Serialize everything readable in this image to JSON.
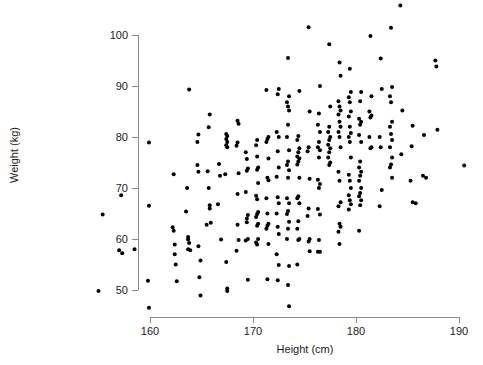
{
  "chart_data": {
    "type": "scatter",
    "title": "",
    "xlabel": "Height (cm)",
    "ylabel": "Weight (kg)",
    "xlim": [
      155,
      191
    ],
    "ylim": [
      46,
      106
    ],
    "xticks": [
      160,
      170,
      180,
      190
    ],
    "yticks": [
      50,
      60,
      70,
      80,
      90,
      100
    ],
    "xtick_labels": [
      "160",
      "170",
      "180",
      "190"
    ],
    "ytick_labels": [
      "50",
      "60",
      "70",
      "80",
      "90",
      "100"
    ],
    "grid": false,
    "legend": null,
    "marker": {
      "shape": "circle",
      "color": "#000000",
      "size_px": 4
    },
    "axis_color": "#8a8a8a",
    "background": "#ffffff",
    "n_points": 284,
    "points": [
      [
        155.0,
        49.8
      ],
      [
        157.0,
        57.8
      ],
      [
        157.3,
        57.2
      ],
      [
        158.5,
        58.0
      ],
      [
        159.9,
        78.9
      ],
      [
        159.9,
        66.5
      ],
      [
        159.8,
        51.8
      ],
      [
        159.9,
        46.5
      ],
      [
        157.2,
        68.6
      ],
      [
        155.4,
        64.8
      ],
      [
        162.3,
        72.7
      ],
      [
        162.2,
        62.3
      ],
      [
        162.3,
        61.6
      ],
      [
        162.4,
        58.9
      ],
      [
        162.4,
        57.0
      ],
      [
        162.5,
        55.0
      ],
      [
        162.6,
        51.7
      ],
      [
        163.8,
        89.3
      ],
      [
        163.6,
        70.0
      ],
      [
        163.5,
        65.4
      ],
      [
        163.7,
        60.4
      ],
      [
        163.7,
        59.9
      ],
      [
        163.8,
        59.2
      ],
      [
        163.7,
        58.0
      ],
      [
        163.9,
        57.8
      ],
      [
        164.7,
        80.5
      ],
      [
        164.6,
        79.0
      ],
      [
        164.6,
        74.5
      ],
      [
        164.7,
        73.2
      ],
      [
        164.7,
        58.6
      ],
      [
        164.8,
        52.5
      ],
      [
        164.9,
        48.9
      ],
      [
        164.9,
        55.8
      ],
      [
        165.8,
        84.4
      ],
      [
        165.7,
        81.9
      ],
      [
        165.6,
        73.3
      ],
      [
        165.7,
        70.0
      ],
      [
        165.8,
        66.6
      ],
      [
        165.8,
        66.0
      ],
      [
        165.9,
        63.2
      ],
      [
        165.5,
        62.8
      ],
      [
        166.7,
        74.7
      ],
      [
        166.8,
        72.4
      ],
      [
        166.6,
        66.8
      ],
      [
        166.9,
        59.9
      ],
      [
        167.4,
        80.6
      ],
      [
        167.5,
        80.2
      ],
      [
        167.4,
        79.6
      ],
      [
        167.5,
        79.0
      ],
      [
        167.4,
        78.4
      ],
      [
        167.5,
        78.0
      ],
      [
        167.4,
        55.5
      ],
      [
        167.5,
        50.3
      ],
      [
        167.5,
        49.8
      ],
      [
        167.3,
        72.7
      ],
      [
        168.5,
        83.2
      ],
      [
        168.6,
        82.6
      ],
      [
        168.5,
        78.9
      ],
      [
        168.4,
        78.3
      ],
      [
        168.6,
        72.9
      ],
      [
        168.5,
        68.8
      ],
      [
        168.5,
        62.8
      ],
      [
        168.6,
        59.8
      ],
      [
        168.4,
        57.7
      ],
      [
        169.3,
        77.0
      ],
      [
        169.4,
        75.7
      ],
      [
        169.5,
        73.8
      ],
      [
        169.4,
        73.4
      ],
      [
        169.3,
        69.2
      ],
      [
        169.5,
        64.7
      ],
      [
        169.4,
        64.0
      ],
      [
        169.4,
        63.3
      ],
      [
        169.5,
        60.0
      ],
      [
        169.3,
        59.7
      ],
      [
        169.5,
        52.0
      ],
      [
        170.4,
        79.4
      ],
      [
        170.3,
        78.4
      ],
      [
        170.4,
        76.2
      ],
      [
        170.5,
        74.0
      ],
      [
        170.4,
        73.6
      ],
      [
        170.5,
        71.0
      ],
      [
        170.3,
        68.5
      ],
      [
        170.4,
        67.8
      ],
      [
        170.5,
        65.3
      ],
      [
        170.4,
        64.9
      ],
      [
        170.3,
        64.3
      ],
      [
        170.5,
        63.0
      ],
      [
        170.4,
        62.6
      ],
      [
        170.5,
        60.0
      ],
      [
        170.3,
        59.3
      ],
      [
        170.4,
        58.9
      ],
      [
        171.3,
        89.2
      ],
      [
        171.5,
        80.0
      ],
      [
        171.4,
        79.6
      ],
      [
        171.3,
        79.0
      ],
      [
        171.5,
        75.8
      ],
      [
        171.4,
        72.0
      ],
      [
        171.5,
        71.5
      ],
      [
        171.3,
        68.0
      ],
      [
        171.4,
        65.0
      ],
      [
        171.5,
        63.0
      ],
      [
        171.4,
        62.6
      ],
      [
        171.3,
        62.0
      ],
      [
        171.5,
        59.0
      ],
      [
        171.4,
        52.1
      ],
      [
        172.5,
        89.4
      ],
      [
        172.4,
        88.4
      ],
      [
        172.3,
        81.0
      ],
      [
        172.5,
        80.0
      ],
      [
        172.4,
        77.2
      ],
      [
        172.5,
        74.0
      ],
      [
        172.3,
        72.2
      ],
      [
        172.4,
        68.2
      ],
      [
        172.5,
        67.0
      ],
      [
        172.3,
        65.0
      ],
      [
        172.4,
        62.4
      ],
      [
        172.5,
        61.0
      ],
      [
        172.3,
        57.0
      ],
      [
        172.5,
        54.9
      ],
      [
        172.4,
        51.9
      ],
      [
        173.4,
        95.5
      ],
      [
        173.5,
        88.0
      ],
      [
        173.3,
        86.8
      ],
      [
        173.4,
        86.0
      ],
      [
        173.5,
        85.2
      ],
      [
        173.4,
        82.4
      ],
      [
        173.3,
        80.0
      ],
      [
        173.5,
        77.4
      ],
      [
        173.4,
        75.2
      ],
      [
        173.3,
        74.5
      ],
      [
        173.5,
        73.5
      ],
      [
        173.4,
        72.0
      ],
      [
        173.3,
        68.0
      ],
      [
        173.5,
        67.0
      ],
      [
        173.4,
        65.5
      ],
      [
        173.3,
        64.9
      ],
      [
        173.5,
        63.4
      ],
      [
        173.4,
        62.0
      ],
      [
        173.3,
        60.0
      ],
      [
        173.5,
        54.7
      ],
      [
        173.4,
        51.0
      ],
      [
        173.5,
        46.8
      ],
      [
        174.5,
        89.0
      ],
      [
        174.4,
        80.2
      ],
      [
        174.3,
        79.4
      ],
      [
        174.5,
        77.8
      ],
      [
        174.4,
        77.0
      ],
      [
        174.3,
        76.2
      ],
      [
        174.5,
        75.8
      ],
      [
        174.4,
        75.2
      ],
      [
        174.3,
        74.6
      ],
      [
        174.5,
        72.0
      ],
      [
        174.4,
        68.4
      ],
      [
        174.3,
        68.0
      ],
      [
        174.5,
        67.0
      ],
      [
        174.4,
        63.5
      ],
      [
        174.3,
        62.0
      ],
      [
        174.5,
        60.0
      ],
      [
        174.4,
        59.8
      ],
      [
        174.3,
        55.0
      ],
      [
        175.4,
        101.5
      ],
      [
        175.5,
        85.0
      ],
      [
        175.4,
        78.0
      ],
      [
        175.3,
        77.2
      ],
      [
        175.5,
        71.8
      ],
      [
        175.4,
        66.0
      ],
      [
        175.3,
        64.5
      ],
      [
        175.5,
        60.0
      ],
      [
        175.4,
        59.5
      ],
      [
        175.5,
        57.6
      ],
      [
        176.5,
        90.0
      ],
      [
        176.4,
        84.6
      ],
      [
        176.3,
        82.4
      ],
      [
        176.5,
        81.0
      ],
      [
        176.4,
        79.0
      ],
      [
        176.3,
        78.0
      ],
      [
        176.5,
        77.4
      ],
      [
        176.4,
        76.0
      ],
      [
        176.3,
        71.6
      ],
      [
        176.5,
        70.8
      ],
      [
        176.4,
        70.0
      ],
      [
        176.3,
        65.9
      ],
      [
        176.5,
        64.8
      ],
      [
        176.4,
        59.8
      ],
      [
        176.3,
        57.5
      ],
      [
        176.5,
        57.5
      ],
      [
        177.4,
        98.2
      ],
      [
        177.5,
        86.0
      ],
      [
        177.4,
        82.0
      ],
      [
        177.3,
        81.0
      ],
      [
        177.5,
        80.0
      ],
      [
        177.4,
        79.4
      ],
      [
        177.3,
        78.5
      ],
      [
        177.5,
        77.8
      ],
      [
        177.4,
        77.0
      ],
      [
        177.3,
        76.0
      ],
      [
        177.5,
        75.0
      ],
      [
        177.4,
        74.5
      ],
      [
        178.4,
        94.6
      ],
      [
        178.5,
        92.0
      ],
      [
        178.3,
        87.0
      ],
      [
        178.4,
        86.0
      ],
      [
        178.5,
        85.2
      ],
      [
        178.3,
        84.4
      ],
      [
        178.4,
        83.0
      ],
      [
        178.5,
        82.0
      ],
      [
        178.3,
        81.0
      ],
      [
        178.4,
        80.0
      ],
      [
        178.5,
        78.0
      ],
      [
        178.3,
        73.2
      ],
      [
        178.4,
        71.4
      ],
      [
        178.5,
        67.2
      ],
      [
        178.3,
        66.4
      ],
      [
        178.4,
        63.0
      ],
      [
        178.5,
        62.4
      ],
      [
        178.3,
        61.4
      ],
      [
        178.4,
        59.0
      ],
      [
        179.4,
        93.4
      ],
      [
        179.5,
        88.8
      ],
      [
        179.3,
        87.8
      ],
      [
        179.4,
        86.8
      ],
      [
        179.5,
        85.0
      ],
      [
        179.3,
        84.0
      ],
      [
        179.4,
        82.0
      ],
      [
        179.5,
        80.8
      ],
      [
        179.3,
        80.0
      ],
      [
        179.4,
        79.0
      ],
      [
        179.5,
        76.0
      ],
      [
        179.3,
        72.6
      ],
      [
        179.4,
        71.4
      ],
      [
        179.5,
        70.0
      ],
      [
        179.3,
        68.6
      ],
      [
        179.4,
        67.6
      ],
      [
        179.5,
        66.8
      ],
      [
        179.3,
        65.8
      ],
      [
        180.5,
        88.8
      ],
      [
        180.4,
        87.0
      ],
      [
        180.3,
        83.6
      ],
      [
        180.5,
        83.0
      ],
      [
        180.4,
        82.4
      ],
      [
        180.3,
        80.4
      ],
      [
        180.5,
        79.0
      ],
      [
        180.4,
        75.2
      ],
      [
        180.3,
        74.0
      ],
      [
        180.5,
        73.2
      ],
      [
        180.4,
        72.4
      ],
      [
        180.3,
        71.4
      ],
      [
        180.5,
        70.0
      ],
      [
        180.4,
        69.0
      ],
      [
        180.3,
        68.4
      ],
      [
        180.5,
        67.6
      ],
      [
        180.4,
        66.6
      ],
      [
        180.3,
        61.6
      ],
      [
        181.4,
        99.8
      ],
      [
        181.5,
        88.0
      ],
      [
        181.3,
        85.0
      ],
      [
        181.5,
        84.2
      ],
      [
        181.4,
        83.8
      ],
      [
        181.3,
        80.0
      ],
      [
        181.5,
        78.0
      ],
      [
        181.4,
        77.8
      ],
      [
        182.4,
        95.4
      ],
      [
        182.5,
        89.4
      ],
      [
        182.3,
        80.0
      ],
      [
        182.4,
        78.0
      ],
      [
        182.5,
        69.6
      ],
      [
        182.3,
        66.4
      ],
      [
        183.4,
        101.4
      ],
      [
        183.5,
        89.8
      ],
      [
        183.3,
        88.0
      ],
      [
        183.4,
        86.8
      ],
      [
        183.5,
        83.0
      ],
      [
        183.3,
        82.0
      ],
      [
        183.4,
        80.6
      ],
      [
        183.5,
        79.4
      ],
      [
        183.3,
        78.0
      ],
      [
        183.5,
        76.0
      ],
      [
        183.4,
        74.6
      ],
      [
        183.3,
        74.0
      ],
      [
        183.5,
        72.0
      ],
      [
        184.3,
        105.8
      ],
      [
        184.5,
        85.2
      ],
      [
        184.4,
        76.6
      ],
      [
        185.5,
        82.2
      ],
      [
        185.4,
        78.2
      ],
      [
        185.3,
        71.4
      ],
      [
        185.5,
        67.2
      ],
      [
        185.8,
        67.0
      ],
      [
        186.6,
        80.4
      ],
      [
        186.5,
        72.4
      ],
      [
        186.8,
        72.0
      ],
      [
        187.7,
        95.0
      ],
      [
        187.8,
        93.8
      ],
      [
        187.9,
        81.4
      ],
      [
        190.5,
        74.4
      ]
    ]
  },
  "figure": {
    "width": 483,
    "height": 365
  }
}
